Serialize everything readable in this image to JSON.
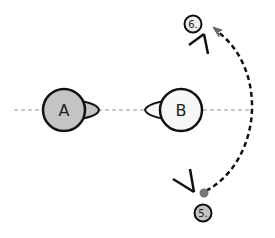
{
  "diagram": {
    "type": "camera-axis-diagram",
    "axis_line": {
      "style": "dotted",
      "color": "#c8c8c8"
    },
    "subjects": [
      {
        "id": "A",
        "label": "A",
        "fill": "#c4c4c4",
        "facing": "right"
      },
      {
        "id": "B",
        "label": "B",
        "fill": "#f7f7f7",
        "facing": "left"
      }
    ],
    "cameras": [
      {
        "id": "5",
        "label": "5.",
        "badge_fill": "#c4c4c4",
        "position": "bottom-right"
      },
      {
        "id": "6",
        "label": "6.",
        "badge_fill": "#f0f0f0",
        "position": "top-right"
      }
    ],
    "move_path": {
      "from": "5",
      "to": "6",
      "style": "dashed",
      "color": "#111111",
      "start_dot_color": "#777777",
      "arrow_color": "#666666"
    }
  }
}
